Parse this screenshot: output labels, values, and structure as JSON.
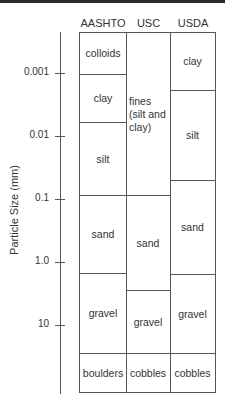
{
  "diagram": {
    "y_axis_label": "Particle Size (mm)",
    "ticks": [
      {
        "label": "0.001",
        "y": 73
      },
      {
        "label": "0.01",
        "y": 136
      },
      {
        "label": "0.1",
        "y": 199
      },
      {
        "label": "1.0",
        "y": 262
      },
      {
        "label": "10",
        "y": 325
      }
    ],
    "columns": [
      {
        "header": "AASHTO",
        "cells": [
          {
            "label": "colloids",
            "top": 0,
            "bottom": 41
          },
          {
            "label": "clay",
            "top": 41,
            "bottom": 89
          },
          {
            "label": "silt",
            "top": 89,
            "bottom": 162
          },
          {
            "label": "sand",
            "top": 162,
            "bottom": 240
          },
          {
            "label": "gravel",
            "top": 240,
            "bottom": 320
          },
          {
            "label": "boulders",
            "top": 320,
            "bottom": 361
          }
        ]
      },
      {
        "header": "USC",
        "cells": [
          {
            "label": "fines (silt and clay)",
            "top": 0,
            "bottom": 162
          },
          {
            "label": "sand",
            "top": 162,
            "bottom": 257
          },
          {
            "label": "gravel",
            "top": 257,
            "bottom": 320
          },
          {
            "label": "cobbles",
            "top": 320,
            "bottom": 361
          }
        ]
      },
      {
        "header": "USDA",
        "cells": [
          {
            "label": "clay",
            "top": 0,
            "bottom": 57
          },
          {
            "label": "silt",
            "top": 57,
            "bottom": 147
          },
          {
            "label": "sand",
            "top": 147,
            "bottom": 241
          },
          {
            "label": "gravel",
            "top": 241,
            "bottom": 320
          },
          {
            "label": "cobbles",
            "top": 320,
            "bottom": 361
          }
        ]
      }
    ]
  },
  "labels": {
    "y_axis": "Particle Size (mm)",
    "aashto": "AASHTO",
    "usc": "USC",
    "usda": "USDA",
    "t0": "0.001",
    "t1": "0.01",
    "t2": "0.1",
    "t3": "1.0",
    "t4": "10",
    "a0": "colloids",
    "a1": "clay",
    "a2": "silt",
    "a3": "sand",
    "a4": "gravel",
    "a5": "boulders",
    "u0": "fines (silt and clay)",
    "u1": "sand",
    "u2": "gravel",
    "u3": "cobbles",
    "d0": "clay",
    "d1": "silt",
    "d2": "sand",
    "d3": "gravel",
    "d4": "cobbles"
  }
}
